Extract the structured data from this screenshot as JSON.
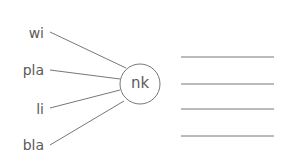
{
  "diagram": {
    "center_syllable": "nk",
    "prefixes": [
      {
        "label": "wi"
      },
      {
        "label": "pla"
      },
      {
        "label": "li"
      },
      {
        "label": "bla"
      }
    ],
    "answer_lines_count": 4,
    "colors": {
      "text": "#5a5a5a",
      "line": "#777777"
    }
  }
}
